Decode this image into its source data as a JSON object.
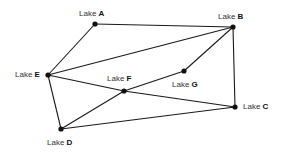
{
  "diagram": {
    "type": "graph",
    "nodes": [
      {
        "id": "A",
        "prefix": "Lake",
        "letter": "A",
        "x": 95,
        "y": 24,
        "lx": 79,
        "ly": 9
      },
      {
        "id": "B",
        "prefix": "Lake",
        "letter": "B",
        "x": 233,
        "y": 27,
        "lx": 218,
        "ly": 12
      },
      {
        "id": "C",
        "prefix": "Lake",
        "letter": "C",
        "x": 235,
        "y": 107,
        "lx": 243,
        "ly": 102
      },
      {
        "id": "D",
        "prefix": "Lake",
        "letter": "D",
        "x": 61,
        "y": 129,
        "lx": 47,
        "ly": 138
      },
      {
        "id": "E",
        "prefix": "Lake",
        "letter": "E",
        "x": 48,
        "y": 75,
        "lx": 15,
        "ly": 70
      },
      {
        "id": "F",
        "prefix": "Lake",
        "letter": "F",
        "x": 124,
        "y": 91,
        "lx": 107,
        "ly": 74
      },
      {
        "id": "G",
        "prefix": "Lake",
        "letter": "G",
        "x": 184,
        "y": 71,
        "lx": 172,
        "ly": 80
      }
    ],
    "edges": [
      [
        "A",
        "B"
      ],
      [
        "A",
        "E"
      ],
      [
        "E",
        "B"
      ],
      [
        "B",
        "G"
      ],
      [
        "G",
        "F"
      ],
      [
        "F",
        "D"
      ],
      [
        "E",
        "F"
      ],
      [
        "F",
        "C"
      ],
      [
        "B",
        "C"
      ],
      [
        "E",
        "D"
      ],
      [
        "D",
        "C"
      ]
    ],
    "colors": {
      "line": "#1a1a1a",
      "node": "#111111",
      "background": "#ffffff"
    }
  }
}
